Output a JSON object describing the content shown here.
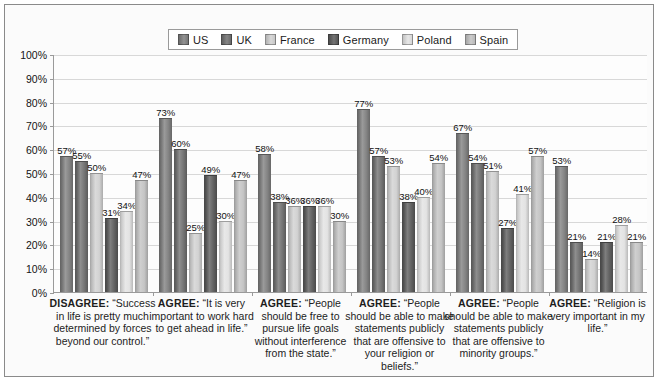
{
  "chart_data": {
    "type": "bar",
    "title": "",
    "subtitle": "",
    "xlabel": "",
    "ylabel": "",
    "ylim": [
      0,
      100
    ],
    "ytick_labels": [
      "100%",
      "90%",
      "80%",
      "70%",
      "60%",
      "50%",
      "40%",
      "30%",
      "20%",
      "10%",
      "0%"
    ],
    "ytick_values": [
      100,
      90,
      80,
      70,
      60,
      50,
      40,
      30,
      20,
      10,
      0
    ],
    "grid": true,
    "legend_position": "top-center",
    "value_label_suffix": "%",
    "categories": [
      "DISAGREE: “Success in life is pretty much determined by forces beyond our control.”",
      "AGREE: “It is very important to work hard to get ahead in life.”",
      "AGREE: “People should be free to pursue life goals without interference from the state.”",
      "AGREE: “People should be able to make statements publicly that are offensive to your religion or beliefs.”",
      "AGREE: “People should be able to make statements publicly that are offensive to minority groups.”",
      "AGREE: “Religion is very important in my life.”"
    ],
    "series": [
      {
        "name": "US",
        "color": "#7d7d7d",
        "values": [
          57,
          73,
          58,
          77,
          67,
          53
        ]
      },
      {
        "name": "UK",
        "color": "#6e6e6e",
        "values": [
          55,
          60,
          38,
          57,
          54,
          21
        ]
      },
      {
        "name": "France",
        "color": "#d0d0d0",
        "values": [
          50,
          25,
          36,
          53,
          51,
          14
        ]
      },
      {
        "name": "Germany",
        "color": "#5a5a5a",
        "values": [
          31,
          49,
          36,
          38,
          27,
          21
        ]
      },
      {
        "name": "Poland",
        "color": "#e2e2e2",
        "values": [
          34,
          30,
          36,
          40,
          41,
          28
        ]
      },
      {
        "name": "Spain",
        "color": "#c2c2c2",
        "values": [
          47,
          47,
          30,
          54,
          57,
          21
        ]
      }
    ]
  },
  "legend": {
    "items": [
      {
        "label": "US"
      },
      {
        "label": "UK"
      },
      {
        "label": "France"
      },
      {
        "label": "Germany"
      },
      {
        "label": "Poland"
      },
      {
        "label": "Spain"
      }
    ]
  },
  "captions": [
    {
      "prefix": "DISAGREE:",
      "text": " “Success in life is pretty much determined by forces beyond our control.”"
    },
    {
      "prefix": "AGREE:",
      "text": " “It is very important to work hard to get ahead in life.”"
    },
    {
      "prefix": "AGREE:",
      "text": " “People should be free to pursue life goals without interference from the state.”"
    },
    {
      "prefix": "AGREE:",
      "text": " “People should be able to make statements publicly that are offensive to your religion or beliefs.”"
    },
    {
      "prefix": "AGREE:",
      "text": " “People should be able to make statements publicly that are offensive to minority groups.”"
    },
    {
      "prefix": "AGREE:",
      "text": " “Religion is very important in my life.”"
    }
  ]
}
